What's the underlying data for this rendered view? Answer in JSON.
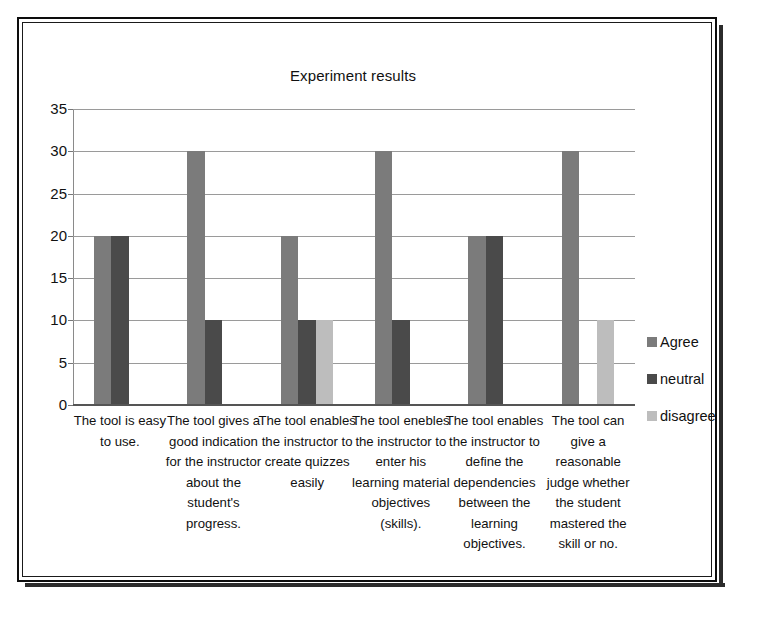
{
  "chart_data": {
    "type": "bar",
    "title": "Experiment results",
    "xlabel": "",
    "ylabel": "",
    "ylim": [
      0,
      35
    ],
    "ytick_step": 5,
    "yticks": [
      "35",
      "30",
      "25",
      "20",
      "15",
      "10",
      "5",
      "0"
    ],
    "grid": true,
    "legend_position": "right",
    "categories": [
      "The tool is easy to use.",
      "The tool gives a good indication for the instructor about the student's progress.",
      "The tool enables the instructor to create quizzes easily",
      "The tool enebles the instructor to enter his learning material objectives (skills).",
      "The tool enables the instructor to define the dependencies between the learning objectives.",
      "The tool can give a reasonable judge whether the student mastered the skill or no."
    ],
    "series": [
      {
        "name": "Agree",
        "color": "#7b7b7b",
        "values": [
          20,
          30,
          20,
          30,
          20,
          30
        ]
      },
      {
        "name": "neutral",
        "color": "#4a4a4a",
        "values": [
          20,
          10,
          10,
          10,
          20,
          0
        ]
      },
      {
        "name": "disagree",
        "color": "#bdbdbd",
        "values": [
          0,
          0,
          10,
          0,
          0,
          10
        ]
      }
    ]
  },
  "legend": {
    "items": [
      {
        "label": "Agree"
      },
      {
        "label": "neutral"
      },
      {
        "label": "disagree"
      }
    ]
  }
}
